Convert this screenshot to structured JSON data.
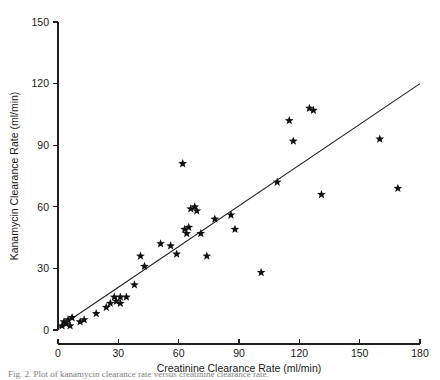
{
  "chart_data": {
    "type": "scatter",
    "title": "",
    "xlabel": "Creatinine Clearance Rate (ml/min)",
    "ylabel": "Kanamycin Clearance Rate (ml/min)",
    "xlim": [
      0,
      180
    ],
    "ylim": [
      0,
      150
    ],
    "xticks": [
      0,
      30,
      60,
      90,
      120,
      150,
      180
    ],
    "yticks": [
      0,
      30,
      60,
      90,
      120,
      150
    ],
    "xtick_labels": [
      "0",
      "30",
      "60",
      "90",
      "120",
      "150",
      "180"
    ],
    "ytick_labels": [
      "0",
      "30",
      "60",
      "90",
      "120",
      "150"
    ],
    "grid": false,
    "legend": false,
    "marker": "star",
    "marker_color": "#111111",
    "line_color": "#1f1f1f",
    "series": [
      {
        "name": "Patients",
        "points": [
          [
            2,
            2
          ],
          [
            3,
            4
          ],
          [
            4,
            3
          ],
          [
            5,
            5
          ],
          [
            6,
            2
          ],
          [
            7,
            6
          ],
          [
            11,
            4
          ],
          [
            13,
            5
          ],
          [
            19,
            8
          ],
          [
            24,
            11
          ],
          [
            26,
            13
          ],
          [
            28,
            16
          ],
          [
            29,
            14
          ],
          [
            31,
            16
          ],
          [
            31,
            13
          ],
          [
            34,
            16
          ],
          [
            38,
            22
          ],
          [
            41,
            36
          ],
          [
            43,
            31
          ],
          [
            51,
            42
          ],
          [
            56,
            41
          ],
          [
            59,
            37
          ],
          [
            62,
            81
          ],
          [
            63,
            49
          ],
          [
            64,
            47
          ],
          [
            65,
            50
          ],
          [
            66,
            59
          ],
          [
            68,
            60
          ],
          [
            69,
            58
          ],
          [
            71,
            47
          ],
          [
            74,
            36
          ],
          [
            78,
            54
          ],
          [
            86,
            56
          ],
          [
            88,
            49
          ],
          [
            101,
            28
          ],
          [
            109,
            72
          ],
          [
            115,
            102
          ],
          [
            117,
            92
          ],
          [
            125,
            108
          ],
          [
            127,
            107
          ],
          [
            131,
            66
          ],
          [
            160,
            93
          ],
          [
            169,
            69
          ]
        ]
      }
    ],
    "fit_line": {
      "name": "regression-line",
      "x_start": 0,
      "y_start": 1,
      "x_end": 180,
      "y_end": 120
    }
  },
  "caption": {
    "text": "Fig. 2. Plot of kanamycin clearance rate versus creatinine clearance rate."
  }
}
